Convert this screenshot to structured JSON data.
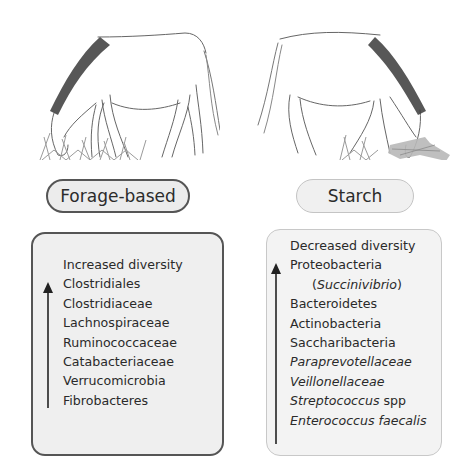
{
  "left": {
    "label": "Forage-based",
    "items": [
      {
        "text": "Increased diversity",
        "italic": false
      },
      {
        "text": "Clostridiales",
        "italic": false
      },
      {
        "text": "Clostridiaceae",
        "italic": false
      },
      {
        "text": "Lachnospiraceae",
        "italic": false
      },
      {
        "text": "Ruminococcaceae",
        "italic": false
      },
      {
        "text": "Catabacteriaceae",
        "italic": false
      },
      {
        "text": "Verrucomicrobia",
        "italic": false
      },
      {
        "text": "Fibrobacteres",
        "italic": false
      }
    ],
    "arrow": "up-arrow",
    "illustration": "horse-grazing-grass"
  },
  "right": {
    "label": "Starch",
    "items": [
      {
        "text": "Decreased diversity"
      },
      {
        "text": "Proteobacteria"
      },
      {
        "pre": "(",
        "italic_text": "Succinivibrio",
        "post": ")"
      },
      {
        "text": "Bacteroidetes"
      },
      {
        "text": "Actinobacteria"
      },
      {
        "text": "Saccharibacteria"
      },
      {
        "italic_text": "Paraprevotellaceae"
      },
      {
        "italic_text": "Veillonellaceae"
      },
      {
        "italic_text": "Streptococcus",
        "post": " spp"
      },
      {
        "italic_text": "Enterococcus faecalis"
      }
    ],
    "arrow": "up-arrow",
    "illustration": "horse-eating-hay-starch"
  },
  "colors": {
    "dark_border": "#555555",
    "light_border": "#c4c4c4",
    "fill": "#ececec",
    "text": "#2a2a2a"
  }
}
